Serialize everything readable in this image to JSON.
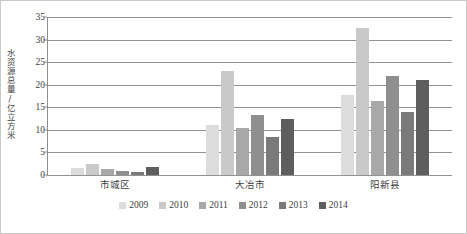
{
  "chart_data": {
    "type": "bar",
    "title": "",
    "subtitle": "",
    "xlabel": "",
    "ylabel": "水资源总量/亿立方米",
    "ylim": [
      0,
      35
    ],
    "yticks": [
      0,
      5,
      10,
      15,
      20,
      25,
      30,
      35
    ],
    "ytick_labels": [
      "0",
      "5",
      "10",
      "15",
      "20",
      "25",
      "30",
      "35"
    ],
    "grid": true,
    "legend_position": "bottom",
    "categories": [
      "市城区",
      "大冶市",
      "阳新县"
    ],
    "series": [
      {
        "name": "2009",
        "color": "#dcdcdc",
        "values": [
          1.5,
          11.0,
          17.8
        ]
      },
      {
        "name": "2010",
        "color": "#c9c9c9",
        "values": [
          2.5,
          23.0,
          32.5
        ]
      },
      {
        "name": "2011",
        "color": "#a8a8a8",
        "values": [
          1.3,
          10.5,
          16.3
        ]
      },
      {
        "name": "2012",
        "color": "#8f8f8f",
        "values": [
          1.0,
          13.2,
          22.0
        ]
      },
      {
        "name": "2013",
        "color": "#7a7a7a",
        "values": [
          0.6,
          8.5,
          14.0
        ]
      },
      {
        "name": "2014",
        "color": "#5e5e5e",
        "values": [
          1.8,
          12.5,
          21.0
        ]
      }
    ]
  },
  "legend": {
    "items": [
      {
        "label": "2009"
      },
      {
        "label": "2010"
      },
      {
        "label": "2011"
      },
      {
        "label": "2012"
      },
      {
        "label": "2013"
      },
      {
        "label": "2014"
      }
    ]
  }
}
